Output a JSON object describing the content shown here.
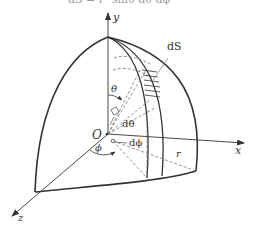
{
  "figure": {
    "title_clipped": "dS = r² sinθ dθ dφ",
    "colors": {
      "stroke": "#333333",
      "dashed": "#777777",
      "background": "#ffffff"
    }
  },
  "axes": {
    "x_label": "x",
    "y_label": "y",
    "z_label": "z",
    "origin_label": "O"
  },
  "labels": {
    "surface_element": "dS",
    "theta": "θ",
    "d_theta": "dθ",
    "phi": "ϕ",
    "d_phi": "dϕ",
    "radius": "r"
  }
}
